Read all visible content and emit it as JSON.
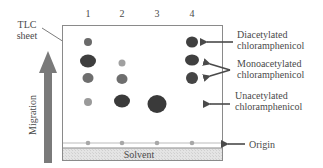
{
  "diagram": {
    "plate_label": [
      "TLC",
      "sheet"
    ],
    "migration_label": "Migration",
    "solvent_label": "Solvent",
    "lanes": [
      {
        "label": "1",
        "x": 88
      },
      {
        "label": "2",
        "x": 122
      },
      {
        "label": "3",
        "x": 157
      },
      {
        "label": "4",
        "x": 192
      }
    ],
    "spots": [
      {
        "lane": 1,
        "x": 88,
        "y": 42,
        "rx": 4,
        "ry": 4,
        "color": "#6a6a6a"
      },
      {
        "lane": 1,
        "x": 88,
        "y": 61,
        "rx": 8,
        "ry": 6.5,
        "color": "#3e3e3e"
      },
      {
        "lane": 1,
        "x": 88,
        "y": 78,
        "rx": 5.5,
        "ry": 5,
        "color": "#6e6e6e"
      },
      {
        "lane": 1,
        "x": 88,
        "y": 102,
        "rx": 4,
        "ry": 4,
        "color": "#9a9a9a"
      },
      {
        "lane": 2,
        "x": 122,
        "y": 63,
        "rx": 3.5,
        "ry": 3.5,
        "color": "#a0a0a0"
      },
      {
        "lane": 2,
        "x": 122,
        "y": 79,
        "rx": 5.5,
        "ry": 5,
        "color": "#6e6e6e"
      },
      {
        "lane": 2,
        "x": 122,
        "y": 101,
        "rx": 8,
        "ry": 6.5,
        "color": "#3a3a3a"
      },
      {
        "lane": 3,
        "x": 157,
        "y": 104,
        "rx": 9.5,
        "ry": 9,
        "color": "#3a3a3a"
      },
      {
        "lane": 4,
        "x": 192,
        "y": 42,
        "rx": 6,
        "ry": 5.5,
        "color": "#404040"
      },
      {
        "lane": 4,
        "x": 192,
        "y": 60,
        "rx": 7,
        "ry": 5.5,
        "color": "#404040"
      },
      {
        "lane": 4,
        "x": 192,
        "y": 78,
        "rx": 6,
        "ry": 6,
        "color": "#454545"
      }
    ],
    "origin_spots_color": "#a8a8a8",
    "annotations": [
      {
        "id": "diacetylated",
        "lines": [
          "Diacetylated",
          "chloramphenicol"
        ]
      },
      {
        "id": "monoacetylated",
        "lines": [
          "Monoacetylated",
          "chloramphenicol"
        ]
      },
      {
        "id": "unacetylated",
        "lines": [
          "Unacetylated",
          "chloramphenicol"
        ]
      },
      {
        "id": "origin",
        "lines": [
          "Origin"
        ]
      }
    ],
    "colors": {
      "frame": "#8a8a8a",
      "arrow": "#7a7a7a",
      "text": "#4a4a4a",
      "solvent_fill": "#e2e2e2"
    }
  }
}
